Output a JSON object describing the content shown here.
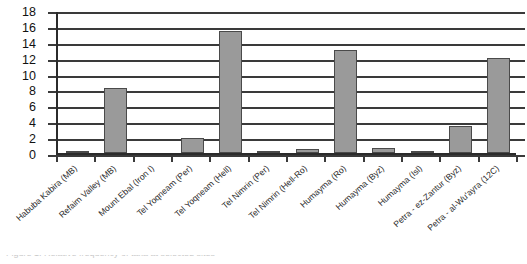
{
  "chart_data": {
    "type": "bar",
    "title": "",
    "xlabel": "",
    "ylabel": "",
    "ylim": [
      0,
      18
    ],
    "ytick_step": 2,
    "grid": true,
    "legend": "none",
    "bar_color": "#9a9a9a",
    "bar_border_color": "#4a4a4a",
    "axis_color": "#3a3a3a",
    "yticks": [
      "18",
      "16",
      "14",
      "12",
      "10",
      "8",
      "6",
      "4",
      "2",
      "0"
    ],
    "categories": [
      "Habuba Kabira (MB)",
      "Refaim Valley (MB)",
      "Mount Ebal (Iron I)",
      "Tel Yoqneam (Per)",
      "Tel Yoqneam (Hell)",
      "Tel Nimrin (Per)",
      "Tel Nimrin (Hell-Ro)",
      "Humayma (Ro)",
      "Humayma (Byz)",
      "Humayma (Isl)",
      "Petra - ez-Zantur (Byz)",
      "Petra - al-Wu'ayra (12C)"
    ],
    "values": [
      0.3,
      8.2,
      0,
      1.9,
      15.3,
      0.1,
      0.55,
      13.0,
      0.65,
      0.2,
      3.4,
      12.0
    ]
  },
  "caption": {
    "clipped_line": "Figure 1. Relative frequency of taxa at selected sites"
  }
}
